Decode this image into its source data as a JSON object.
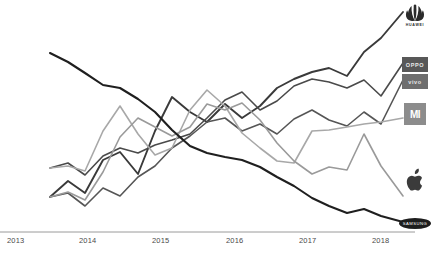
{
  "chart_data": {
    "type": "line",
    "title": "",
    "subtitle": "",
    "xlabel": "",
    "ylabel": "",
    "grid": false,
    "legend_position": "right-endpoint-logos",
    "x": [
      "2013",
      "2014",
      "2015",
      "2016",
      "2017",
      "2018"
    ],
    "xlim": [
      "2013",
      "2018.6"
    ],
    "ylim": [
      0,
      100
    ],
    "axis": {
      "x_tick_labels": [
        "2013",
        "2014",
        "2015",
        "2016",
        "2017",
        "2018"
      ],
      "x_tick_pixel_x": [
        7,
        79,
        152,
        226,
        299,
        372
      ],
      "baseline_y": 232,
      "baseline_color": "#9a9a9a"
    },
    "series": [
      {
        "name": "Huawei",
        "logo": "huawei-logo",
        "color": "#3a3a3a",
        "width": 1.9,
        "points": [
          [
            50,
            197
          ],
          [
            68,
            181
          ],
          [
            85,
            193
          ],
          [
            103,
            160
          ],
          [
            120,
            152
          ],
          [
            138,
            174
          ],
          [
            155,
            131
          ],
          [
            172,
            97
          ],
          [
            190,
            112
          ],
          [
            207,
            122
          ],
          [
            225,
            104
          ],
          [
            242,
            118
          ],
          [
            260,
            106
          ],
          [
            277,
            88
          ],
          [
            294,
            79
          ],
          [
            312,
            72
          ],
          [
            329,
            68
          ],
          [
            347,
            76
          ],
          [
            364,
            52
          ],
          [
            381,
            38
          ],
          [
            403,
            12
          ]
        ]
      },
      {
        "name": "OPPO",
        "logo": "oppo-logo",
        "color": "#4a4a4a",
        "width": 1.6,
        "points": [
          [
            50,
            168
          ],
          [
            68,
            163
          ],
          [
            85,
            175
          ],
          [
            103,
            156
          ],
          [
            120,
            148
          ],
          [
            138,
            153
          ],
          [
            155,
            145
          ],
          [
            172,
            140
          ],
          [
            190,
            134
          ],
          [
            207,
            118
          ],
          [
            225,
            100
          ],
          [
            242,
            92
          ],
          [
            260,
            110
          ],
          [
            277,
            101
          ],
          [
            294,
            86
          ],
          [
            312,
            79
          ],
          [
            329,
            82
          ],
          [
            347,
            88
          ],
          [
            364,
            80
          ],
          [
            381,
            96
          ],
          [
            403,
            63
          ]
        ]
      },
      {
        "name": "vivo",
        "logo": "vivo-logo",
        "color": "#565656",
        "width": 1.6,
        "points": [
          [
            50,
            197
          ],
          [
            68,
            193
          ],
          [
            85,
            206
          ],
          [
            103,
            188
          ],
          [
            120,
            196
          ],
          [
            138,
            177
          ],
          [
            155,
            166
          ],
          [
            172,
            148
          ],
          [
            190,
            136
          ],
          [
            207,
            122
          ],
          [
            225,
            118
          ],
          [
            242,
            131
          ],
          [
            260,
            124
          ],
          [
            277,
            134
          ],
          [
            294,
            119
          ],
          [
            312,
            110
          ],
          [
            329,
            120
          ],
          [
            347,
            126
          ],
          [
            364,
            112
          ],
          [
            381,
            124
          ],
          [
            403,
            80
          ]
        ]
      },
      {
        "name": "Xiaomi",
        "logo": "xiaomi-logo",
        "color": "#a8a8a8",
        "width": 1.6,
        "points": [
          [
            50,
            168
          ],
          [
            68,
            166
          ],
          [
            85,
            171
          ],
          [
            103,
            131
          ],
          [
            120,
            106
          ],
          [
            138,
            134
          ],
          [
            155,
            155
          ],
          [
            172,
            148
          ],
          [
            190,
            110
          ],
          [
            207,
            90
          ],
          [
            225,
            106
          ],
          [
            242,
            133
          ],
          [
            260,
            148
          ],
          [
            277,
            161
          ],
          [
            294,
            163
          ],
          [
            312,
            131
          ],
          [
            329,
            130
          ],
          [
            347,
            127
          ],
          [
            364,
            124
          ],
          [
            381,
            122
          ],
          [
            403,
            118
          ]
        ]
      },
      {
        "name": "Apple",
        "logo": "apple-logo",
        "color": "#9a9a9a",
        "width": 1.6,
        "points": [
          [
            50,
            197
          ],
          [
            68,
            192
          ],
          [
            85,
            200
          ],
          [
            103,
            172
          ],
          [
            120,
            137
          ],
          [
            138,
            118
          ],
          [
            155,
            127
          ],
          [
            172,
            136
          ],
          [
            190,
            127
          ],
          [
            207,
            104
          ],
          [
            225,
            110
          ],
          [
            242,
            103
          ],
          [
            260,
            120
          ],
          [
            277,
            143
          ],
          [
            294,
            161
          ],
          [
            312,
            174
          ],
          [
            329,
            167
          ],
          [
            347,
            170
          ],
          [
            364,
            134
          ],
          [
            381,
            166
          ],
          [
            403,
            196
          ]
        ]
      },
      {
        "name": "Samsung",
        "logo": "samsung-logo",
        "color": "#1f1f1f",
        "width": 2.1,
        "points": [
          [
            50,
            53
          ],
          [
            68,
            62
          ],
          [
            85,
            73
          ],
          [
            103,
            85
          ],
          [
            120,
            88
          ],
          [
            138,
            99
          ],
          [
            155,
            112
          ],
          [
            172,
            130
          ],
          [
            190,
            146
          ],
          [
            207,
            153
          ],
          [
            225,
            157
          ],
          [
            242,
            160
          ],
          [
            260,
            167
          ],
          [
            277,
            177
          ],
          [
            294,
            186
          ],
          [
            312,
            198
          ],
          [
            329,
            206
          ],
          [
            347,
            213
          ],
          [
            364,
            209
          ],
          [
            381,
            216
          ],
          [
            403,
            222
          ]
        ]
      }
    ]
  },
  "logos": {
    "huawei": {
      "name": "huawei-logo",
      "wordmark": "HUAWEI"
    },
    "oppo": {
      "name": "oppo-logo",
      "wordmark": "OPPO"
    },
    "vivo": {
      "name": "vivo-logo",
      "wordmark": "vivo"
    },
    "xiaomi": {
      "name": "xiaomi-logo",
      "wordmark": "MI"
    },
    "apple": {
      "name": "apple-logo",
      "wordmark": ""
    },
    "samsung": {
      "name": "samsung-logo",
      "wordmark": "SAMSUNG"
    }
  },
  "colors": {
    "background": "#ffffff",
    "axis": "#9a9a9a",
    "tick_text": "#4a4a4a",
    "samsung": "#1f1f1f",
    "huawei": "#3a3a3a",
    "oppo": "#4a4a4a",
    "vivo": "#565656",
    "xiaomi": "#a8a8a8",
    "apple": "#9a9a9a"
  }
}
